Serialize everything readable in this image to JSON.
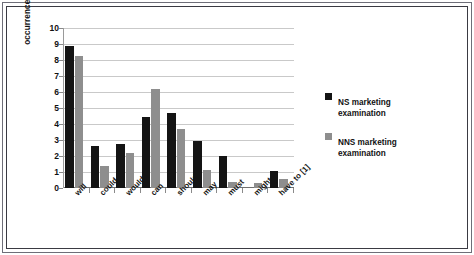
{
  "chart_data": {
    "type": "bar",
    "title": "",
    "xlabel": "",
    "ylabel": "occurrences per 1,000 words",
    "ylim": [
      0,
      10
    ],
    "ytick_labels": [
      "0",
      "1",
      "2",
      "3",
      "4",
      "5",
      "6",
      "7",
      "8",
      "9",
      "10"
    ],
    "ytick_values": [
      0,
      1,
      2,
      3,
      4,
      5,
      6,
      7,
      8,
      9,
      10
    ],
    "grid": true,
    "legend_position": "right",
    "categories": [
      "will",
      "could",
      "would",
      "can",
      "should",
      "may",
      "must",
      "might",
      "have to [1]"
    ],
    "series": [
      {
        "name": "NS marketing examination",
        "name_line1": "NS marketing",
        "name_line2": "examination",
        "color": "#141414",
        "values": [
          8.85,
          2.65,
          2.75,
          4.45,
          4.7,
          2.95,
          2.0,
          0.0,
          1.05
        ]
      },
      {
        "name": "NNS marketing examination",
        "name_line1": "NNS marketing",
        "name_line2": "examination",
        "color": "#8e8e8e",
        "values": [
          8.25,
          1.35,
          2.2,
          6.2,
          3.7,
          1.1,
          0.4,
          0.3,
          0.55
        ]
      }
    ]
  }
}
